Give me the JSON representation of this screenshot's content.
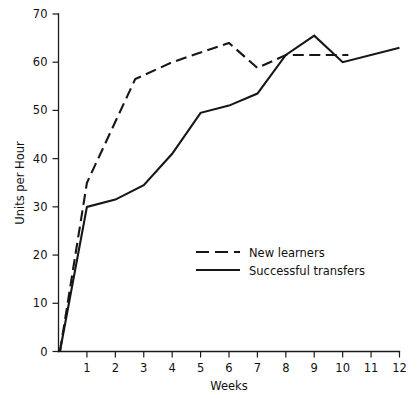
{
  "chart_data": {
    "type": "line",
    "title": "",
    "subtitle": "",
    "xlabel": "Weeks",
    "ylabel": "Units per Hour",
    "xlim": [
      0,
      12
    ],
    "ylim": [
      0,
      70
    ],
    "grid": false,
    "legend_position": "center",
    "x_ticks": [
      "1",
      "2",
      "3",
      "4",
      "5",
      "6",
      "7",
      "8",
      "9",
      "10",
      "11",
      "12"
    ],
    "x_tick_values": [
      1,
      2,
      3,
      4,
      5,
      6,
      7,
      8,
      9,
      10,
      11,
      12
    ],
    "y_ticks": [
      "0",
      "10",
      "20",
      "30",
      "40",
      "50",
      "60",
      "70"
    ],
    "y_tick_values": [
      0,
      10,
      20,
      30,
      40,
      50,
      60,
      70
    ],
    "series": [
      {
        "name": "New learners",
        "style": "dashed",
        "color": "#16161a",
        "points": [
          [
            0.05,
            0
          ],
          [
            1.0,
            35
          ],
          [
            2.7,
            56.5
          ],
          [
            4.0,
            60.0
          ],
          [
            5.0,
            62.0
          ],
          [
            6.0,
            64.0
          ],
          [
            7.0,
            58.8
          ],
          [
            8.0,
            61.5
          ],
          [
            10.2,
            61.5
          ]
        ]
      },
      {
        "name": "Successful transfers",
        "style": "solid",
        "color": "#16161a",
        "points": [
          [
            0.05,
            0
          ],
          [
            1.0,
            30.0
          ],
          [
            2.0,
            31.5
          ],
          [
            3.0,
            34.5
          ],
          [
            4.0,
            41.0
          ],
          [
            5.0,
            49.5
          ],
          [
            6.0,
            51.0
          ],
          [
            7.0,
            53.5
          ],
          [
            8.0,
            61.5
          ],
          [
            9.0,
            65.5
          ],
          [
            10.0,
            60.0
          ],
          [
            12.0,
            63.0
          ]
        ]
      }
    ],
    "legend": [
      {
        "label": "New learners",
        "style": "dashed"
      },
      {
        "label": "Successful transfers",
        "style": "solid"
      }
    ]
  }
}
